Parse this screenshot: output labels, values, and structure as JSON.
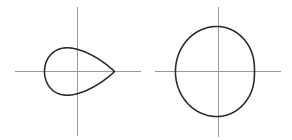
{
  "figures": [
    {
      "id": "teardrop",
      "description": "closed teardrop curve pointed to the right",
      "origin": [
        77.5,
        71.5
      ],
      "x_axis": [
        15,
        141
      ],
      "y_axis": [
        7,
        136
      ],
      "shape": "teardrop",
      "params": {
        "left": 33,
        "right": 37,
        "half_height": 29
      },
      "colors": {
        "axis": "#9a9a9a",
        "curve": "#2a2a2a"
      }
    },
    {
      "id": "dimpled",
      "description": "closed near-circular curve with an inward dimple on the right",
      "origin": [
        218.5,
        71.5
      ],
      "x_axis": [
        155,
        281
      ],
      "y_axis": [
        7,
        137
      ],
      "shape": "dimpled",
      "params": {
        "radius": 45,
        "dimple": 0.07
      },
      "colors": {
        "axis": "#9a9a9a",
        "curve": "#2a2a2a"
      }
    }
  ]
}
